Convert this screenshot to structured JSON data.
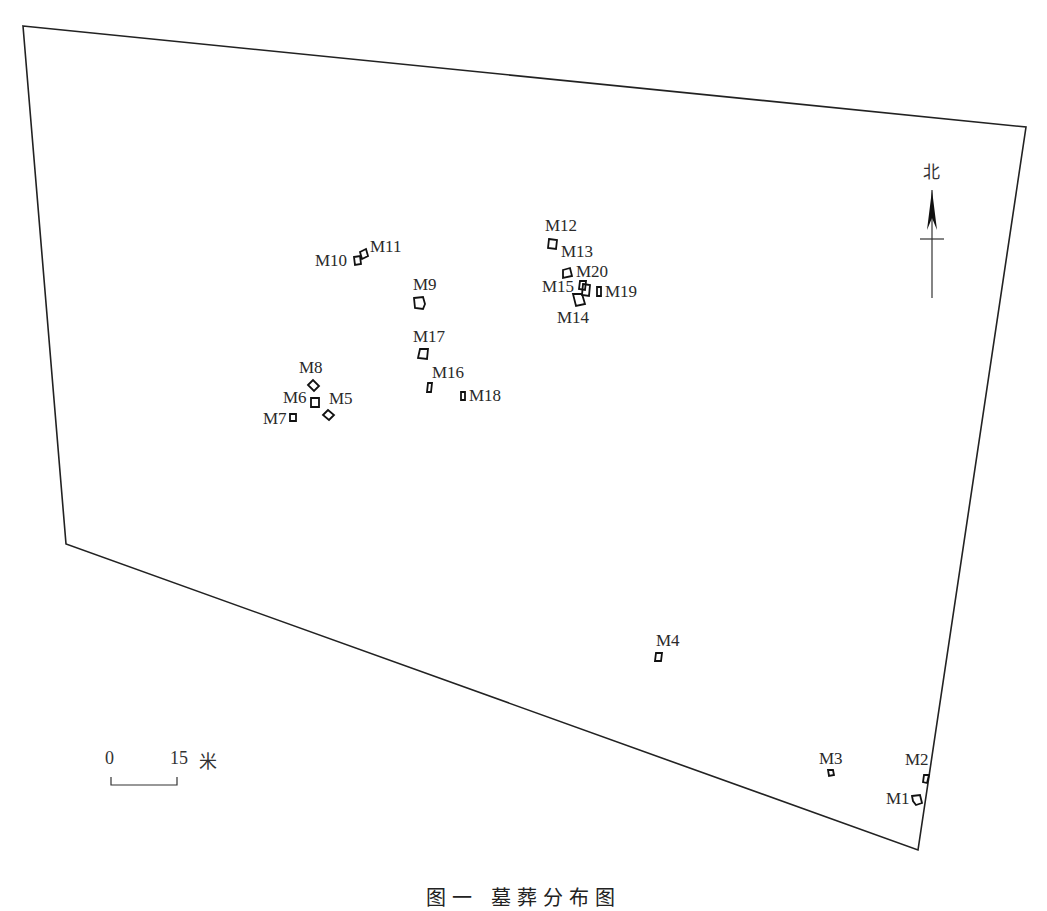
{
  "map": {
    "boundary": {
      "points": [
        [
          23,
          26
        ],
        [
          1026,
          127
        ],
        [
          918,
          850
        ],
        [
          66,
          544
        ]
      ],
      "stroke": "#222222"
    },
    "north_arrow": {
      "label": "北",
      "x": 932,
      "top": 180,
      "bottom": 298
    },
    "scale_bar": {
      "start_label": "0",
      "end_label": "15",
      "unit": "米"
    },
    "caption": "图一  墓葬分布图",
    "tombs": [
      {
        "id": "M1",
        "label": "M1",
        "label_x": 886,
        "label_y": 790,
        "shape": [
          [
            912,
            796
          ],
          [
            920,
            795
          ],
          [
            922,
            803
          ],
          [
            916,
            805
          ],
          [
            913,
            801
          ]
        ]
      },
      {
        "id": "M2",
        "label": "M2",
        "label_x": 905,
        "label_y": 751,
        "shape": [
          [
            924,
            775
          ],
          [
            929,
            775
          ],
          [
            927,
            783
          ],
          [
            923,
            782
          ]
        ]
      },
      {
        "id": "M3",
        "label": "M3",
        "label_x": 819,
        "label_y": 750,
        "shape": [
          [
            828,
            770
          ],
          [
            833,
            770
          ],
          [
            834,
            775
          ],
          [
            829,
            776
          ]
        ]
      },
      {
        "id": "M4",
        "label": "M4",
        "label_x": 656,
        "label_y": 632,
        "shape": [
          [
            656,
            653
          ],
          [
            662,
            653
          ],
          [
            661,
            661
          ],
          [
            655,
            661
          ]
        ]
      },
      {
        "id": "M5",
        "label": "M5",
        "label_x": 329,
        "label_y": 390,
        "shape": [
          [
            323,
            415
          ],
          [
            328,
            410
          ],
          [
            334,
            415
          ],
          [
            329,
            420
          ]
        ]
      },
      {
        "id": "M6",
        "label": "M6",
        "label_x": 283,
        "label_y": 389,
        "shape": [
          [
            311,
            398
          ],
          [
            319,
            398
          ],
          [
            319,
            407
          ],
          [
            311,
            407
          ]
        ]
      },
      {
        "id": "M7",
        "label": "M7",
        "label_x": 263,
        "label_y": 410,
        "shape": [
          [
            290,
            414
          ],
          [
            296,
            414
          ],
          [
            296,
            421
          ],
          [
            290,
            421
          ]
        ]
      },
      {
        "id": "M8",
        "label": "M8",
        "label_x": 299,
        "label_y": 359,
        "shape": [
          [
            308,
            385
          ],
          [
            313,
            380
          ],
          [
            319,
            386
          ],
          [
            314,
            391
          ]
        ]
      },
      {
        "id": "M9",
        "label": "M9",
        "label_x": 413,
        "label_y": 276,
        "shape": [
          [
            414,
            298
          ],
          [
            423,
            297
          ],
          [
            425,
            304
          ],
          [
            423,
            309
          ],
          [
            415,
            308
          ]
        ]
      },
      {
        "id": "M10",
        "label": "M10",
        "label_x": 315,
        "label_y": 252,
        "shape": [
          [
            354,
            257
          ],
          [
            360,
            256
          ],
          [
            361,
            264
          ],
          [
            355,
            265
          ]
        ]
      },
      {
        "id": "M11",
        "label": "M11",
        "label_x": 370,
        "label_y": 238,
        "shape": [
          [
            360,
            252
          ],
          [
            366,
            249
          ],
          [
            368,
            256
          ],
          [
            362,
            259
          ]
        ]
      },
      {
        "id": "M12",
        "label": "M12",
        "label_x": 545,
        "label_y": 217,
        "shape": [
          [
            549,
            239
          ],
          [
            557,
            240
          ],
          [
            556,
            249
          ],
          [
            548,
            248
          ]
        ]
      },
      {
        "id": "M13",
        "label": "M13",
        "label_x": 561,
        "label_y": 243,
        "shape": [
          [
            563,
            270
          ],
          [
            570,
            268
          ],
          [
            572,
            276
          ],
          [
            563,
            278
          ]
        ]
      },
      {
        "id": "M14",
        "label": "M14",
        "label_x": 557,
        "label_y": 309,
        "shape": [
          [
            573,
            294
          ],
          [
            582,
            294
          ],
          [
            585,
            304
          ],
          [
            576,
            306
          ]
        ]
      },
      {
        "id": "M15",
        "label": "M15",
        "label_x": 542,
        "label_y": 278,
        "shape": [
          [
            580,
            281
          ],
          [
            586,
            281
          ],
          [
            585,
            290
          ],
          [
            579,
            289
          ]
        ]
      },
      {
        "id": "M16",
        "label": "M16",
        "label_x": 432,
        "label_y": 364,
        "shape": [
          [
            428,
            383
          ],
          [
            432,
            383
          ],
          [
            431,
            392
          ],
          [
            427,
            392
          ]
        ]
      },
      {
        "id": "M17",
        "label": "M17",
        "label_x": 413,
        "label_y": 328,
        "shape": [
          [
            420,
            349
          ],
          [
            428,
            349
          ],
          [
            427,
            359
          ],
          [
            418,
            358
          ]
        ]
      },
      {
        "id": "M18",
        "label": "M18",
        "label_x": 469,
        "label_y": 387,
        "shape": [
          [
            461,
            392
          ],
          [
            465,
            392
          ],
          [
            465,
            400
          ],
          [
            461,
            400
          ]
        ]
      },
      {
        "id": "M19",
        "label": "M19",
        "label_x": 605,
        "label_y": 283,
        "shape": [
          [
            597,
            287
          ],
          [
            601,
            287
          ],
          [
            601,
            296
          ],
          [
            597,
            296
          ]
        ]
      },
      {
        "id": "M20",
        "label": "M20",
        "label_x": 576,
        "label_y": 263,
        "shape": [
          [
            583,
            284
          ],
          [
            590,
            285
          ],
          [
            589,
            296
          ],
          [
            582,
            295
          ]
        ]
      }
    ]
  }
}
